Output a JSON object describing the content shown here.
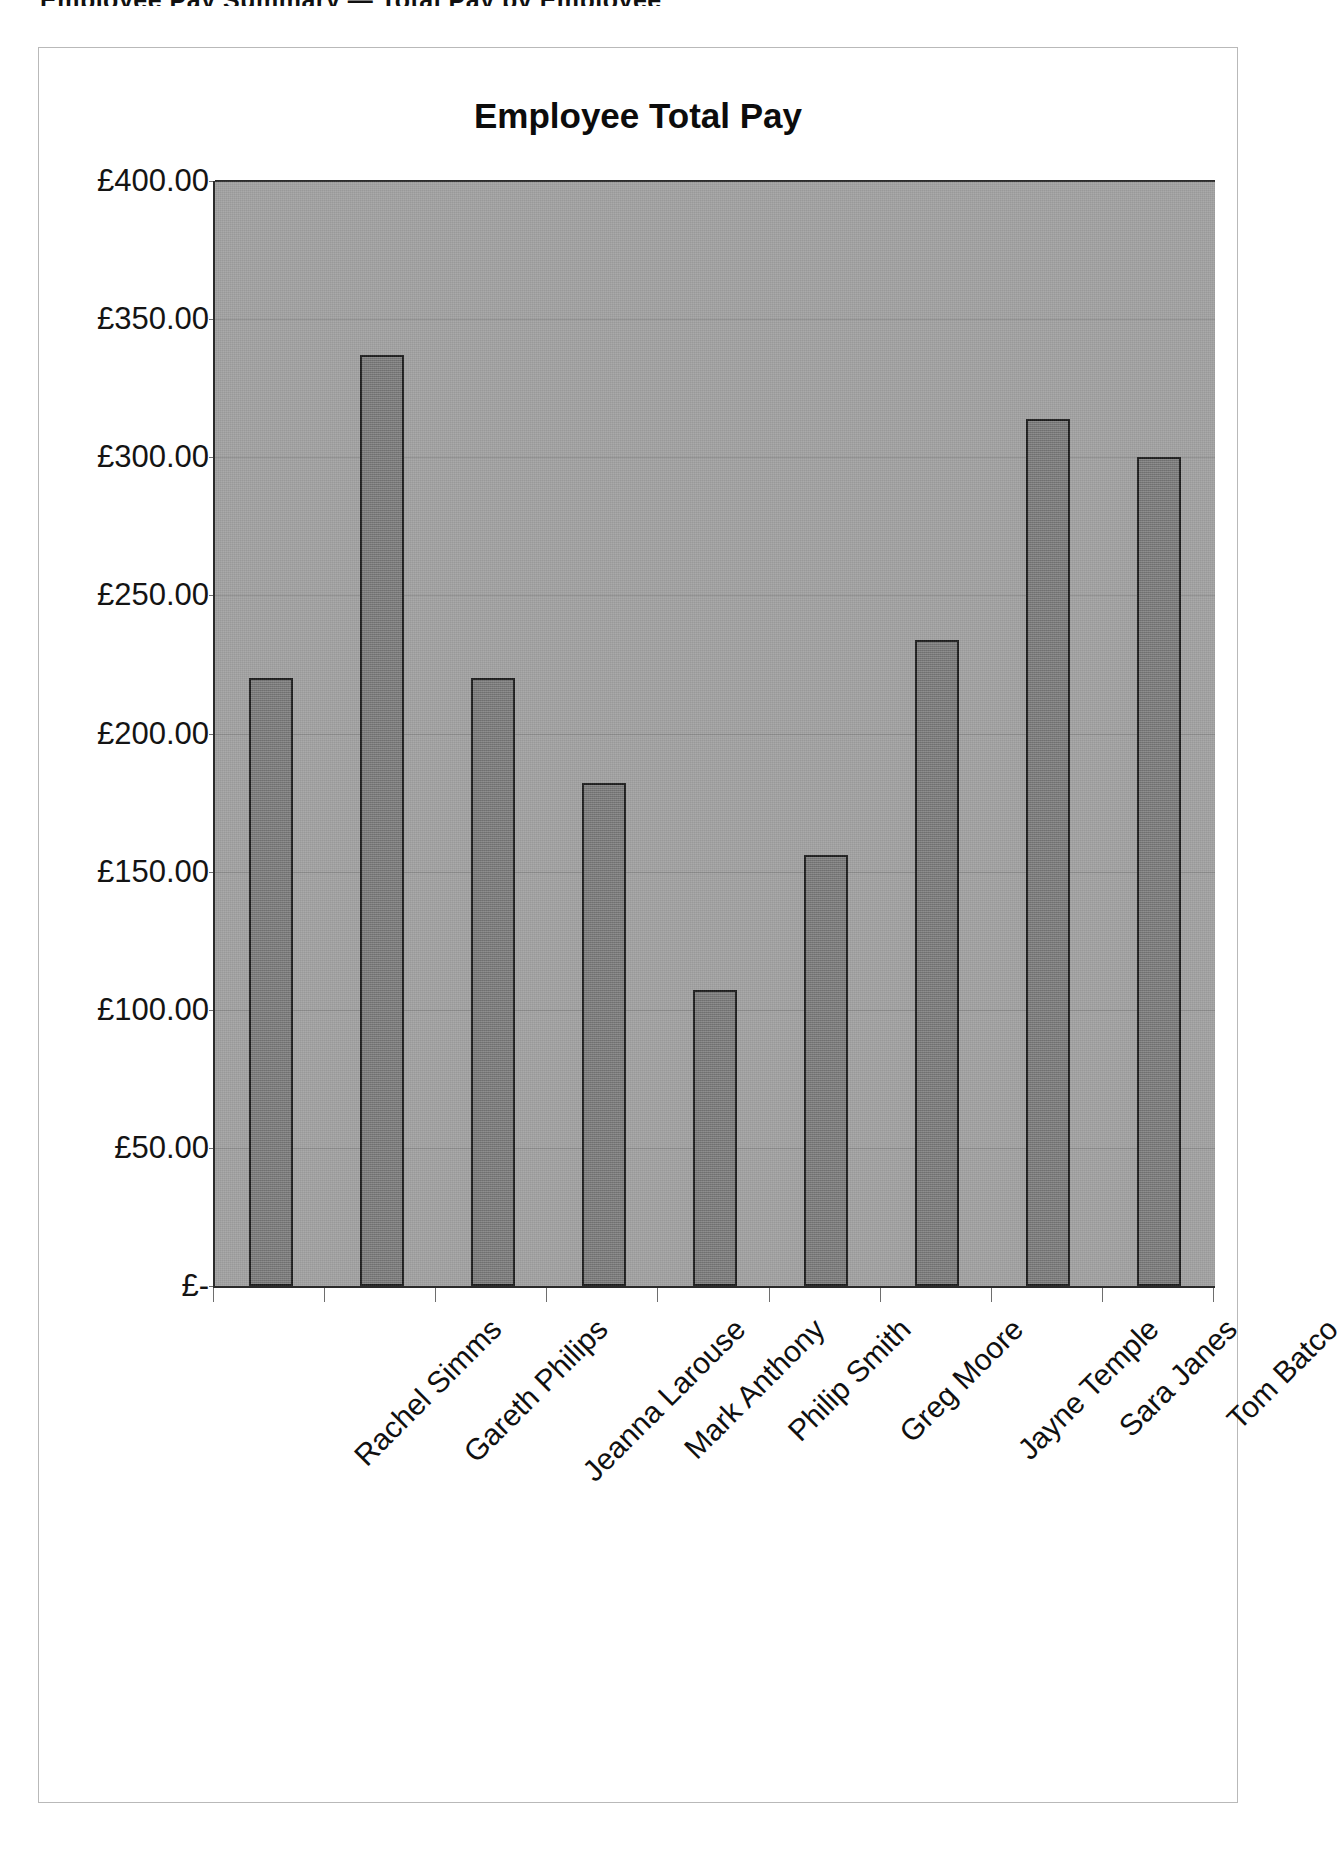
{
  "page": {
    "header_sliver": "Employee Pay Summary — Total Pay by Employee"
  },
  "chart_data": {
    "type": "bar",
    "title": "Employee Total Pay",
    "xlabel": "",
    "ylabel": "",
    "currency_symbol": "£",
    "ylim": [
      0,
      400
    ],
    "ytick_values": [
      400,
      350,
      300,
      250,
      200,
      150,
      100,
      50,
      0
    ],
    "ytick_labels": [
      "£400.00",
      "£350.00",
      "£300.00",
      "£250.00",
      "£200.00",
      "£150.00",
      "£100.00",
      "£50.00",
      "£-"
    ],
    "grid": true,
    "legend": false,
    "plot_background": "#a2a2a2",
    "bar_color": "#7d7d7d",
    "bar_border_color": "#1d1d1d",
    "categories": [
      "Rachel Simms",
      "Gareth Philips",
      "Jeanna Larouse",
      "Mark Anthony",
      "Philip Smith",
      "Greg Moore",
      "Jayne Temple",
      "Sara Janes",
      "Tom Batco"
    ],
    "values": [
      220,
      337,
      220,
      182,
      107,
      156,
      234,
      314,
      300
    ],
    "value_labels": [
      "£220.00",
      "£337.00",
      "£220.00",
      "£182.00",
      "£107.00",
      "£156.00",
      "£234.00",
      "£314.00",
      "£300.00"
    ]
  }
}
